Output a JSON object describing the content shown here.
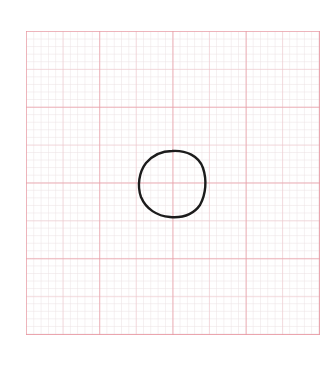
{
  "image": {
    "description": "Hand-drawn circle on pink graph paper",
    "paper": {
      "major_divisions_x": 4,
      "major_divisions_y": 4,
      "grid_color": "#e896a0",
      "minor_grid_color": "#ece2e4",
      "background": "#ffffff"
    },
    "shape": {
      "type": "circle",
      "stroke_color": "#1a1a1a",
      "center": [
        172,
        184
      ],
      "radius": 33
    }
  }
}
